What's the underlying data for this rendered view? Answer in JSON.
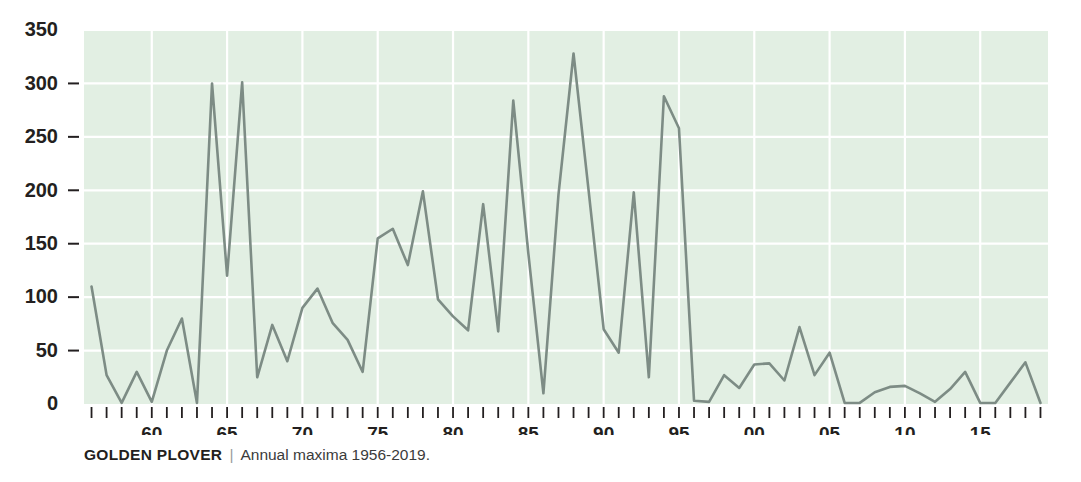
{
  "caption": {
    "title": "GOLDEN PLOVER",
    "separator": "|",
    "subtitle": "Annual maxima 1956-2019."
  },
  "colors": {
    "plot_background": "#e2efe3",
    "gridline": "#ffffff",
    "line": "#7d8c85",
    "text": "#231f20",
    "separator": "#9a9a9a"
  },
  "chart_data": {
    "type": "line",
    "title": "GOLDEN PLOVER",
    "subtitle": "Annual maxima 1956-2019.",
    "xlabel": "",
    "ylabel": "",
    "xlim": [
      1955.5,
      2019.5
    ],
    "ylim": [
      0,
      350
    ],
    "grid": true,
    "legend": null,
    "y_ticks": [
      0,
      50,
      100,
      150,
      200,
      250,
      300,
      350
    ],
    "y_tick_labels": [
      "0",
      "50",
      "100",
      "150",
      "200",
      "250",
      "300",
      "350"
    ],
    "x_ticks": [
      1956,
      1957,
      1958,
      1959,
      1960,
      1961,
      1962,
      1963,
      1964,
      1965,
      1966,
      1967,
      1968,
      1969,
      1970,
      1971,
      1972,
      1973,
      1974,
      1975,
      1976,
      1977,
      1978,
      1979,
      1980,
      1981,
      1982,
      1983,
      1984,
      1985,
      1986,
      1987,
      1988,
      1989,
      1990,
      1991,
      1992,
      1993,
      1994,
      1995,
      1996,
      1997,
      1998,
      1999,
      2000,
      2001,
      2002,
      2003,
      2004,
      2005,
      2006,
      2007,
      2008,
      2009,
      2010,
      2011,
      2012,
      2013,
      2014,
      2015,
      2016,
      2017,
      2018,
      2019
    ],
    "x_tick_labels": [
      {
        "year": 1960,
        "label": "60"
      },
      {
        "year": 1965,
        "label": "65"
      },
      {
        "year": 1970,
        "label": "70"
      },
      {
        "year": 1975,
        "label": "75"
      },
      {
        "year": 1980,
        "label": "80"
      },
      {
        "year": 1985,
        "label": "85"
      },
      {
        "year": 1990,
        "label": "90"
      },
      {
        "year": 1995,
        "label": "95"
      },
      {
        "year": 2000,
        "label": "00"
      },
      {
        "year": 2005,
        "label": "05"
      },
      {
        "year": 2010,
        "label": "10"
      },
      {
        "year": 2015,
        "label": "15"
      }
    ],
    "x": [
      1956,
      1957,
      1958,
      1959,
      1960,
      1961,
      1962,
      1963,
      1964,
      1965,
      1966,
      1967,
      1968,
      1969,
      1970,
      1971,
      1972,
      1973,
      1974,
      1975,
      1976,
      1977,
      1978,
      1979,
      1980,
      1981,
      1982,
      1983,
      1984,
      1985,
      1986,
      1987,
      1988,
      1989,
      1990,
      1991,
      1992,
      1993,
      1994,
      1995,
      1996,
      1997,
      1998,
      1999,
      2000,
      2001,
      2002,
      2003,
      2004,
      2005,
      2006,
      2007,
      2008,
      2009,
      2010,
      2011,
      2012,
      2013,
      2014,
      2015,
      2016,
      2017,
      2018,
      2019
    ],
    "values": [
      110,
      27,
      1,
      30,
      2,
      50,
      80,
      1,
      300,
      120,
      301,
      25,
      74,
      40,
      90,
      108,
      76,
      60,
      30,
      155,
      164,
      130,
      199,
      98,
      82,
      69,
      187,
      68,
      284,
      141,
      10,
      196,
      328,
      200,
      70,
      48,
      198,
      25,
      288,
      258,
      3,
      2,
      27,
      15,
      37,
      38,
      22,
      72,
      27,
      48,
      1,
      1,
      11,
      16,
      17,
      10,
      2,
      14,
      30,
      1,
      1,
      20,
      39,
      1
    ]
  }
}
